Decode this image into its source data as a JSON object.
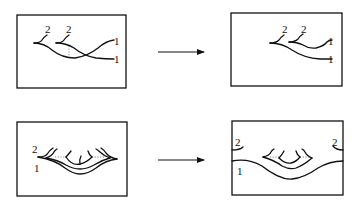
{
  "figure": {
    "panels": [
      {
        "id": "top-left",
        "labels": [
          {
            "text": "2"
          },
          {
            "text": "2"
          },
          {
            "text": "1"
          },
          {
            "text": "1"
          }
        ]
      },
      {
        "id": "top-right",
        "labels": [
          {
            "text": "2"
          },
          {
            "text": "2"
          },
          {
            "text": "1"
          },
          {
            "text": "1"
          }
        ]
      },
      {
        "id": "bottom-left",
        "labels": [
          {
            "text": "2"
          },
          {
            "text": "1"
          }
        ]
      },
      {
        "id": "bottom-right",
        "labels": [
          {
            "text": "2"
          },
          {
            "text": "2"
          },
          {
            "text": "1"
          }
        ]
      }
    ],
    "arrows": [
      {
        "id": "top-arrow",
        "direction": "right"
      },
      {
        "id": "bottom-arrow",
        "direction": "right"
      }
    ],
    "colors": {
      "stroke": "#111111",
      "background": "#ffffff"
    }
  }
}
